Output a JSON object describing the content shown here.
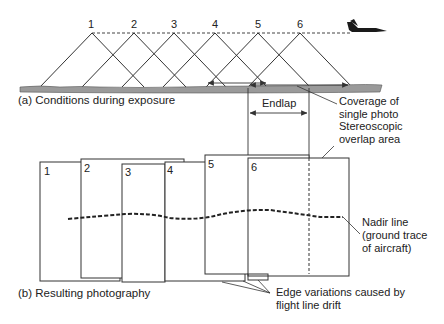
{
  "figure": {
    "panel_a": {
      "caption": "(a) Conditions during exposure",
      "camera_stations": [
        "1",
        "2",
        "3",
        "4",
        "5",
        "6"
      ],
      "endlap_label": "Endlap",
      "coverage_label_line1": "Coverage of",
      "coverage_label_line2": "single photo",
      "stereo_label_line1": "Stereoscopic",
      "stereo_label_line2": "overlap area",
      "aircraft_icon": "jet-aircraft-icon"
    },
    "panel_b": {
      "caption": "(b) Resulting photography",
      "photos": [
        "1",
        "2",
        "3",
        "4",
        "5",
        "6"
      ],
      "nadir_label_line1": "Nadir line",
      "nadir_label_line2": "(ground trace",
      "nadir_label_line3": "of aircraft)",
      "edge_label_line1": "Edge variations caused by",
      "edge_label_line2": "flight line drift"
    },
    "colors": {
      "line": "#333333",
      "ground": "#9a9a9a",
      "background": "#ffffff"
    }
  }
}
